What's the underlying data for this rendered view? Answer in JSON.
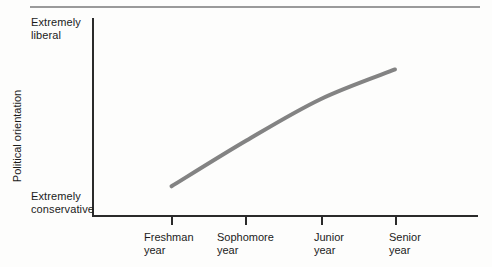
{
  "chart_data": {
    "type": "line",
    "title": "",
    "xlabel": "",
    "ylabel": "Political orientation",
    "categories": [
      "Freshman\nyear",
      "Sophomore\nyear",
      "Junior\nyear",
      "Senior\nyear"
    ],
    "x": [
      1,
      2,
      3,
      4
    ],
    "values": [
      0.15,
      0.38,
      0.59,
      0.74
    ],
    "y_axis_low_label": "Extremely\nconservative",
    "y_axis_high_label": "Extremely\nliberal",
    "ylim": [
      0,
      1
    ],
    "xlim": [
      0.5,
      4.5
    ],
    "grid": false,
    "legend": null,
    "series": [
      {
        "name": "Political orientation",
        "values": [
          0.15,
          0.38,
          0.59,
          0.74
        ],
        "color": "#838383",
        "line_width": 4,
        "markers": false
      }
    ],
    "annotations": []
  },
  "axes": {
    "y_title": "Political orientation",
    "y_top_label": "Extremely\nliberal",
    "y_bottom_label": "Extremely\nconservative",
    "x_tick_labels": [
      "Freshman\nyear",
      "Sophomore\nyear",
      "Junior\nyear",
      "Senior\nyear"
    ]
  },
  "colors": {
    "curve": "#838383",
    "axis": "#2a2a2a",
    "top_rule": "#9a9a9a",
    "background": "#fdfdfc",
    "text": "#1b1b1b"
  }
}
